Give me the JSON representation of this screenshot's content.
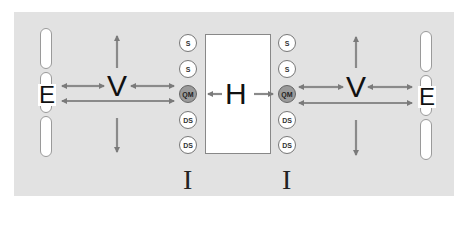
{
  "diagram": {
    "background_color": "#e2e2e2",
    "arrow_color": "#7a7a7a",
    "left": {
      "e_label": "E",
      "v_label": "V",
      "i_label": "I",
      "circles": [
        {
          "label": "S",
          "type": "plain"
        },
        {
          "label": "S",
          "type": "plain"
        },
        {
          "label": "QM",
          "type": "highlight"
        },
        {
          "label": "DS",
          "type": "plain"
        },
        {
          "label": "DS",
          "type": "plain"
        }
      ]
    },
    "center": {
      "h_label": "H"
    },
    "right": {
      "e_label": "E",
      "v_label": "V",
      "i_label": "I",
      "circles": [
        {
          "label": "S",
          "type": "plain"
        },
        {
          "label": "S",
          "type": "plain"
        },
        {
          "label": "QM",
          "type": "highlight"
        },
        {
          "label": "DS",
          "type": "plain"
        },
        {
          "label": "DS",
          "type": "plain"
        }
      ]
    }
  }
}
